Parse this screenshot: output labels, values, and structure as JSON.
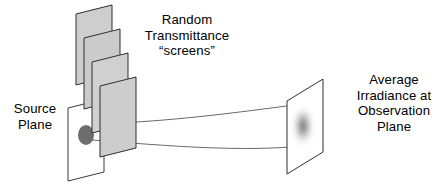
{
  "figure": {
    "kind": "optical-propagation-schematic",
    "width": 442,
    "height": 192,
    "background_color": "#ffffff",
    "line_color": "#444444",
    "text_color": "#000000"
  },
  "labels": {
    "source_plane": "Source\nPlane",
    "screens": "Random\nTransmittance\n“screens”",
    "observation": "Average\nIrradiance at\nObservation\nPlane"
  },
  "elements": {
    "source_plane": {
      "name": "Source Plane",
      "fill": "#ffffff",
      "stroke": "#3a3a3a",
      "source_spot": {
        "name": "source spot",
        "fill": "#6d6d6d",
        "shape": "ellipse"
      }
    },
    "screens": {
      "name": "Random Transmittance screens",
      "count": 4,
      "fill": "speckle-texture",
      "base_color": "#b9b9b9",
      "stroke": "#2f2f2f"
    },
    "beam": {
      "name": "diverging beam rays",
      "stroke": "#6a6a6a",
      "ray_count": 2
    },
    "observation_plane": {
      "name": "Observation Plane",
      "fill": "#ffffff",
      "stroke": "#2f2f2f",
      "irradiance_blob": {
        "name": "average irradiance blob",
        "fill": "#555555",
        "shape": "blurred-ellipse"
      }
    }
  }
}
